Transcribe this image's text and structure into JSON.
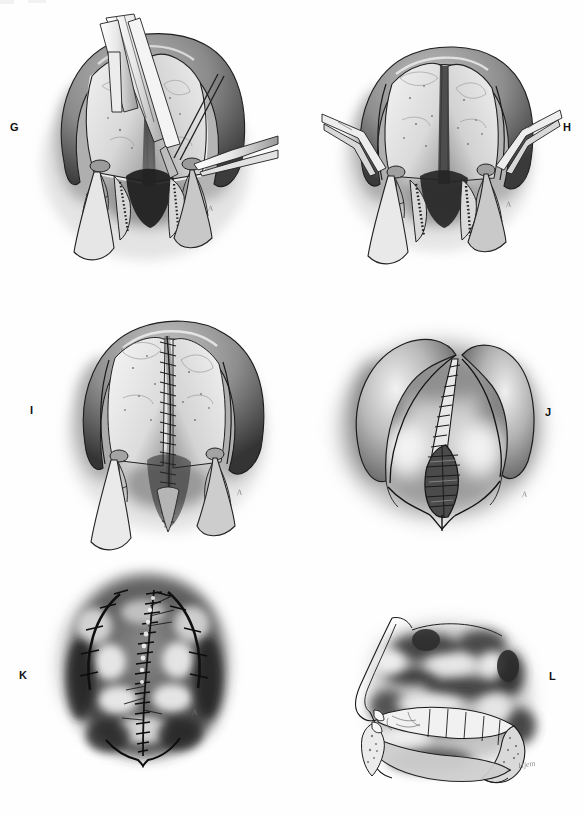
{
  "figure": {
    "kind": "surgical-atlas-plate",
    "technique": "grayscale pen-and-ink with wash",
    "background_color": "#fefefe",
    "ink_color": "#1a1a1a",
    "panel_count": 6
  },
  "panels": [
    {
      "label": "G",
      "label_side": "left",
      "caption_text": "",
      "signature": "A",
      "view": "intraoral view of hard palate with mucoperiosteal flaps elevated, multiple surgical instruments and needle holders in field",
      "elements": [
        "alveolar arch",
        "elevated mucoperiosteal flap (left)",
        "elevated mucoperiosteal flap (right)",
        "exposed palatal bone",
        "greater palatine vessel pedicle (left)",
        "greater palatine vessel pedicle (right)",
        "vomerine / nasal mucosa flap",
        "forceps instrument",
        "needle holder",
        "suture needle",
        "retracted uvular halves"
      ]
    },
    {
      "label": "H",
      "label_side": "right",
      "caption_text": "",
      "signature": "A",
      "view": "intraoral view after instrument withdrawal; bilateral flaps held laterally by fine hooks, nasal mucosa closure visible in midline",
      "elements": [
        "alveolar arch",
        "mucoperiosteal flap (left)",
        "mucoperiosteal flap (right)",
        "exposed palatal bone",
        "lateral relaxing incision (left)",
        "lateral relaxing incision (right)",
        "greater palatine pedicle (left)",
        "greater palatine pedicle (right)",
        "nasal layer suture line",
        "skin hook retractor (left)",
        "skin hook retractor (right)",
        "uvular halves"
      ]
    },
    {
      "label": "I",
      "label_side": "left",
      "caption_text": "",
      "signature": "A",
      "view": "intraoral view with midline oral mucosa suture line completed from incisive region through soft palate",
      "elements": [
        "alveolar arch",
        "midline interrupted suture line",
        "lateral denuded bone (left)",
        "lateral denuded bone (right)",
        "greater palatine pedicle (left)",
        "greater palatine pedicle (right)",
        "lateral relaxing incision (left)",
        "lateral relaxing incision (right)",
        "sutured uvula"
      ]
    },
    {
      "label": "J",
      "label_side": "right",
      "caption_text": "",
      "signature": "A",
      "view": "close intraoral wash study of completed midline closure through soft palate and uvula",
      "elements": [
        "palatal shelf (left)",
        "palatal shelf (right)",
        "midline suture line",
        "soft palate cross-hatched muscle repair",
        "uvula",
        "lateral incision scar"
      ]
    },
    {
      "label": "K",
      "label_side": "left",
      "caption_text": "",
      "signature": "A",
      "view": "full intraoral wash rendering of healed palate with midline suture line and bilateral lateral suture lines",
      "elements": [
        "alveolar ridge",
        "midline suture line",
        "lateral suture line (left)",
        "lateral suture line (right)",
        "interrupted suture knots",
        "soft palate",
        "uvula notch"
      ]
    },
    {
      "label": "L",
      "label_side": "right",
      "caption_text": "",
      "signature": "Hjem",
      "view": "midsagittal section of nose, nasopharynx, hard and soft palate and tongue after repair",
      "elements": [
        "nasal dorsum profile",
        "nasal septum",
        "nasopharynx",
        "adenoid pad",
        "posterior pharyngeal wall",
        "hard palate",
        "soft palate / velum",
        "uvula",
        "tongue",
        "mandible symphysis",
        "upper incisor",
        "lower incisor"
      ]
    }
  ],
  "labels_text": {
    "g": "G",
    "h": "H",
    "i": "I",
    "j": "J",
    "k": "K",
    "l": "L"
  },
  "signatures_text": {
    "g": "A",
    "h": "A",
    "i": "A",
    "j": "A",
    "k": "A",
    "l": "Hjem"
  }
}
